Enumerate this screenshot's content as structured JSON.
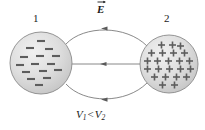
{
  "figure": {
    "background_color": "#ffffff",
    "width": 205,
    "height": 130
  },
  "labels": {
    "sphere_1_number": "1",
    "sphere_2_number": "2",
    "efield_symbol": "E",
    "potential_relation_v1": "V",
    "potential_relation_sub1": "1",
    "potential_relation_operator": "<",
    "potential_relation_v2": "V",
    "potential_relation_sub2": "2",
    "potential_relation_full": "V1 < V2"
  },
  "spheres": [
    {
      "id": "sphere-1",
      "number": "1",
      "charge_sign": "minus",
      "charge_symbol": "−",
      "center_x": 41,
      "center_y": 63,
      "radius": 31,
      "fill_color": "#dcdcdc",
      "stroke_color": "#808080",
      "charge_count": 17,
      "charge_positions": [
        [
          41,
          41
        ],
        [
          30,
          48
        ],
        [
          49,
          49
        ],
        [
          24,
          57
        ],
        [
          40,
          56
        ],
        [
          56,
          56
        ],
        [
          20,
          65
        ],
        [
          35,
          64
        ],
        [
          51,
          64
        ],
        [
          26,
          72
        ],
        [
          43,
          71
        ],
        [
          58,
          70
        ],
        [
          31,
          79
        ],
        [
          47,
          78
        ],
        [
          39,
          85
        ]
      ]
    },
    {
      "id": "sphere-2",
      "number": "2",
      "charge_sign": "plus",
      "charge_symbol": "+",
      "center_x": 169,
      "center_y": 64,
      "radius": 29,
      "fill_color": "#dcdcdc",
      "stroke_color": "#808080",
      "charge_count": 23,
      "charge_positions": [
        [
          161,
          45
        ],
        [
          172,
          45
        ],
        [
          180,
          46
        ],
        [
          151,
          53
        ],
        [
          162,
          53
        ],
        [
          173,
          53
        ],
        [
          184,
          53
        ],
        [
          147,
          61
        ],
        [
          157,
          61
        ],
        [
          168,
          61
        ],
        [
          179,
          61
        ],
        [
          189,
          61
        ],
        [
          147,
          68
        ],
        [
          158,
          68
        ],
        [
          169,
          68
        ],
        [
          180,
          68
        ],
        [
          190,
          68
        ],
        [
          154,
          76
        ],
        [
          165,
          76
        ],
        [
          176,
          76
        ],
        [
          186,
          76
        ],
        [
          162,
          84
        ],
        [
          174,
          84
        ]
      ]
    }
  ],
  "field_lines": [
    {
      "id": "field-line-top",
      "shape": "curve",
      "direction": "right-to-left",
      "arrow_position_x": 105,
      "arrow_position_y": 29,
      "stroke_color": "#6b6b6b"
    },
    {
      "id": "field-line-middle",
      "shape": "straight",
      "direction": "right-to-left",
      "arrow_position_x": 104,
      "arrow_position_y": 64,
      "stroke_color": "#6b6b6b"
    },
    {
      "id": "field-line-bottom",
      "shape": "curve",
      "direction": "right-to-left",
      "arrow_position_x": 105,
      "arrow_position_y": 99,
      "stroke_color": "#6b6b6b"
    }
  ],
  "colors": {
    "sphere_fill": "#dcdcdc",
    "sphere_stroke": "#808080",
    "charge_glyph": "#555555",
    "field_line": "#6b6b6b",
    "text": "#1a1a1a",
    "background": "#ffffff"
  }
}
